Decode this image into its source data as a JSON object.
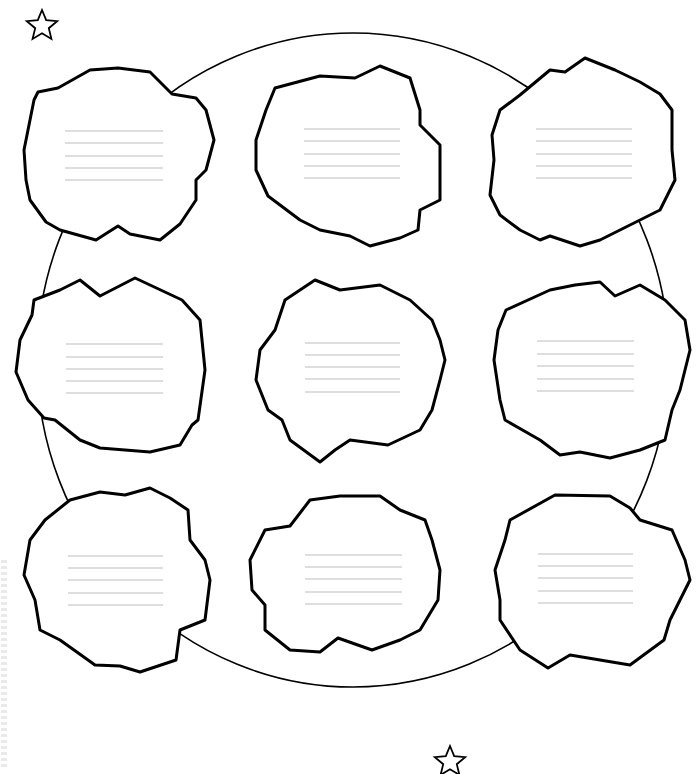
{
  "worksheet": {
    "title": "Cloud graphic organizer",
    "background": "#ffffff",
    "stroke_color": "#000000",
    "writing_line_color": "#bdbdbd",
    "side_strip_text": ""
  },
  "decorations": {
    "stars": [
      {
        "name": "star-top-left",
        "cx": 42,
        "cy": 26,
        "r": 16
      },
      {
        "name": "star-bottom",
        "cx": 450,
        "cy": 762,
        "r": 16
      }
    ],
    "big_circle": {
      "cx": 353,
      "cy": 360,
      "rx": 316,
      "ry": 327
    }
  },
  "clouds": [
    {
      "id": "cloud-1",
      "points": "38,92 58,88 90,70 118,68 150,72 172,94 196,98 206,110 214,140 206,170 196,180 196,200 180,224 160,240 130,234 118,226 96,240 60,230 46,222 30,200 26,180 24,150 30,120 34,100",
      "lines": {
        "x1": 65,
        "x2": 163,
        "ys": [
          131,
          143,
          156,
          168,
          180
        ]
      }
    },
    {
      "id": "cloud-2",
      "points": "275,88 320,76 355,78 380,66 410,78 420,110 420,125 440,145 440,200 420,210 418,230 400,238 370,246 350,236 320,230 300,220 268,196 256,170 256,140 266,110",
      "lines": {
        "x1": 304,
        "x2": 400,
        "ys": [
          129,
          141,
          154,
          166,
          178
        ]
      }
    },
    {
      "id": "cloud-3",
      "points": "550,70 565,72 585,58 615,70 640,82 660,94 672,110 672,150 675,180 665,200 660,210 640,220 620,230 600,240 580,246 550,236 540,240 520,230 500,215 490,195 494,160 492,135 500,110 520,95",
      "lines": {
        "x1": 536,
        "x2": 632,
        "ys": [
          129,
          141,
          154,
          166,
          178
        ]
      }
    },
    {
      "id": "cloud-4",
      "points": "60,290 80,280 100,296 135,278 150,285 182,300 200,320 202,340 205,370 198,420 192,425 180,445 150,452 100,448 80,440 55,420 44,418 28,400 16,372 20,340 32,315 34,300",
      "lines": {
        "x1": 66,
        "x2": 163,
        "ys": [
          344,
          357,
          369,
          381,
          393
        ]
      }
    },
    {
      "id": "cloud-5",
      "points": "315,280 340,290 380,285 410,300 432,320 440,340 445,360 440,380 432,410 420,430 388,445 350,440 335,450 320,462 290,440 282,420 268,410 256,380 260,350 275,330 285,300",
      "lines": {
        "x1": 305,
        "x2": 400,
        "ys": [
          343,
          355,
          367,
          379,
          392
        ]
      }
    },
    {
      "id": "cloud-6",
      "points": "506,310 550,290 575,285 600,282 615,296 640,285 665,300 685,320 690,350 680,390 672,410 665,440 640,450 610,458 580,452 560,455 540,440 505,420 500,400 494,360 498,330",
      "lines": {
        "x1": 537,
        "x2": 634,
        "ys": [
          341,
          354,
          366,
          379,
          391
        ]
      }
    },
    {
      "id": "cloud-7",
      "points": "70,500 100,492 125,495 150,488 170,498 188,510 190,540 205,560 210,580 205,620 180,630 176,660 140,672 120,666 95,665 60,640 40,630 35,600 24,575 30,540 45,520",
      "lines": {
        "x1": 68,
        "x2": 163,
        "ys": [
          556,
          568,
          580,
          593,
          605
        ]
      }
    },
    {
      "id": "cloud-8",
      "points": "310,500 340,496 380,496 400,510 425,520 432,540 440,570 438,600 420,630 400,640 372,650 338,638 320,652 290,650 265,630 265,605 252,590 250,560 265,530 290,526",
      "lines": {
        "x1": 305,
        "x2": 402,
        "ys": [
          555,
          567,
          579,
          592,
          604
        ]
      }
    },
    {
      "id": "cloud-9",
      "points": "510,520 555,495 610,496 630,508 640,520 672,530 685,560 690,580 680,600 670,620 664,640 630,665 600,660 570,655 548,668 520,650 500,620 500,600 495,570 505,540",
      "lines": {
        "x1": 538,
        "x2": 633,
        "ys": [
          554,
          566,
          578,
          591,
          603
        ]
      }
    }
  ]
}
